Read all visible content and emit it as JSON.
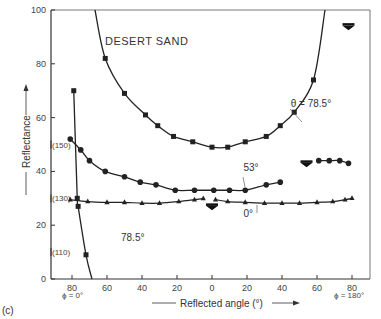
{
  "figure_label": "(c)",
  "chart_data": {
    "type": "line",
    "title": "DESERT SAND",
    "xlabel": "Reflected angle (°)",
    "ylabel": "Reflectance",
    "xlim": [
      -90,
      90
    ],
    "ylim": [
      0,
      100
    ],
    "x_ticks": [
      "80",
      "60",
      "40",
      "20",
      "0",
      "20",
      "40",
      "60",
      "80"
    ],
    "x_tick_values": [
      -80,
      -60,
      -40,
      -20,
      0,
      20,
      40,
      60,
      80
    ],
    "y_ticks": [
      "0",
      "20",
      "40",
      "60",
      "80",
      "100"
    ],
    "y_tick_values": [
      0,
      20,
      40,
      60,
      80,
      100
    ],
    "x_side_labels": {
      "left": "ϕ = 0°",
      "right": "ϕ = 180°"
    },
    "y_side_labels": [
      {
        "text": "(150)",
        "y": 50
      },
      {
        "text": "(130)",
        "y": 30
      },
      {
        "text": "(110)",
        "y": 10
      }
    ],
    "grid": false,
    "series": [
      {
        "name": "θ = 78.5°",
        "marker": "square",
        "x": [
          -61,
          -50,
          -38,
          -31,
          -22,
          -11,
          0,
          9,
          19,
          31,
          39,
          47,
          58
        ],
        "values": [
          82,
          69,
          61,
          57,
          53,
          51,
          49,
          49,
          51,
          53,
          57,
          62,
          74
        ]
      },
      {
        "name": "53°",
        "marker": "circle",
        "x": [
          -81,
          -75,
          -70,
          -61,
          -50,
          -41,
          -32,
          -21,
          -10,
          1,
          10,
          19,
          31,
          39
        ],
        "values": [
          52,
          48,
          44,
          40,
          38,
          36,
          35,
          33,
          33,
          33,
          33,
          33,
          35,
          36
        ]
      },
      {
        "name": "53° (specular region)",
        "marker": "circle",
        "x": [
          61,
          67,
          73,
          78
        ],
        "values": [
          44,
          44,
          44,
          43
        ]
      },
      {
        "name": "0°",
        "marker": "triangle",
        "x": [
          -81,
          -71,
          -60,
          -50,
          -40,
          -30,
          -19,
          -10,
          -5,
          2,
          9,
          19,
          30,
          40,
          50,
          60,
          69,
          76,
          80
        ],
        "values": [
          29.5,
          28.8,
          28.5,
          28.5,
          28.2,
          28.2,
          28.8,
          29.5,
          29.9,
          29.5,
          28.8,
          28.5,
          28.2,
          28.2,
          28.2,
          28.5,
          28.8,
          29.5,
          30
        ]
      },
      {
        "name": "78.5° (ϕ = 0°)",
        "marker": "square",
        "x": [
          -79,
          -77,
          -76.5,
          -72
        ],
        "values": [
          70,
          30,
          27,
          9
        ]
      }
    ],
    "annotations": [
      {
        "text": "θ = 78.5°",
        "x": 45,
        "y": 64
      },
      {
        "text": "53°",
        "x": 18,
        "y": 40
      },
      {
        "text": "0°",
        "x": 18,
        "y": 23
      },
      {
        "text": "78.5°",
        "x": -52,
        "y": 14
      }
    ],
    "arrows": [
      {
        "x": 78,
        "y": 94,
        "note": "specular direction θ = 78.5°"
      },
      {
        "x": 54,
        "y": 43,
        "note": "specular direction 53°"
      },
      {
        "x": 0,
        "y": 27,
        "note": "specular direction 0°"
      }
    ]
  }
}
